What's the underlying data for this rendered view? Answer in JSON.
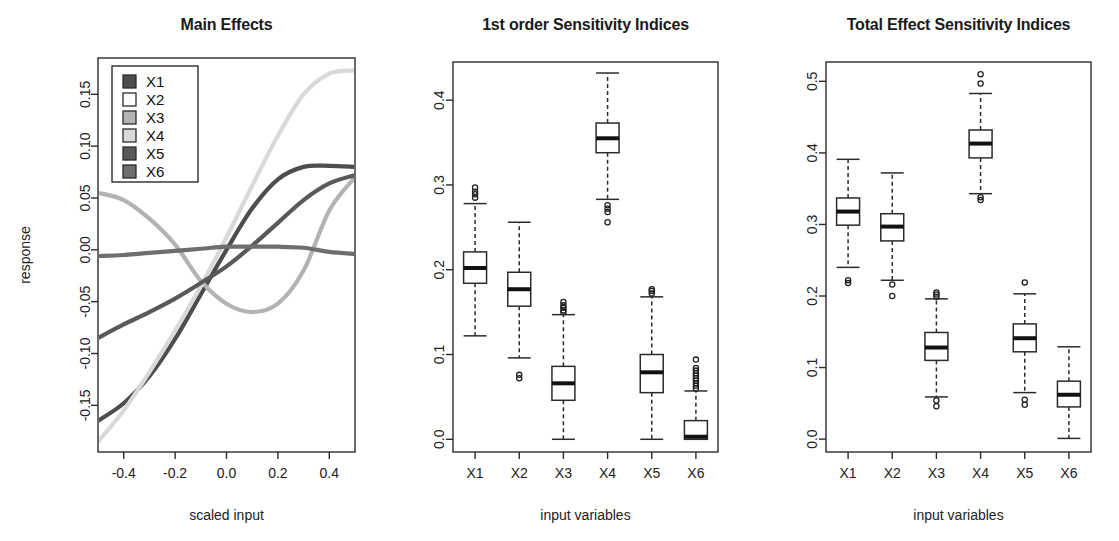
{
  "figure": {
    "variables": [
      "X1",
      "X2",
      "X3",
      "X4",
      "X5",
      "X6"
    ],
    "series_colors": [
      "#4d4d4d",
      "#ffffff",
      "#b3b3b3",
      "#d9d9d9",
      "#595959",
      "#6e6e6e"
    ]
  },
  "panels": {
    "left": {
      "title": "Main Effects",
      "xlabel": "scaled input",
      "ylabel": "response",
      "xticks": [
        "-0.4",
        "-0.2",
        "0.0",
        "0.2",
        "0.4"
      ],
      "yticks": [
        "-0.15",
        "-0.10",
        "-0.05",
        "0.00",
        "0.05",
        "0.10",
        "0.15"
      ],
      "legend": [
        "X1",
        "X2",
        "X3",
        "X4",
        "X5",
        "X6"
      ]
    },
    "middle": {
      "title": "1st order Sensitivity Indices",
      "xlabel": "input variables",
      "xticks": [
        "X1",
        "X2",
        "X3",
        "X4",
        "X5",
        "X6"
      ],
      "yticks": [
        "0.0",
        "0.1",
        "0.2",
        "0.3",
        "0.4"
      ]
    },
    "right": {
      "title": "Total Effect Sensitivity Indices",
      "xlabel": "input variables",
      "xticks": [
        "X1",
        "X2",
        "X3",
        "X4",
        "X5",
        "X6"
      ],
      "yticks": [
        "0.0",
        "0.1",
        "0.2",
        "0.3",
        "0.4",
        "0.5"
      ]
    }
  },
  "chart_data": [
    {
      "type": "line",
      "panel": "left",
      "title": "Main Effects",
      "xlabel": "scaled input",
      "ylabel": "response",
      "xlim": [
        -0.5,
        0.5
      ],
      "ylim": [
        -0.195,
        0.185
      ],
      "grid": false,
      "legend_position": "top-left",
      "x": [
        -0.5,
        -0.4,
        -0.3,
        -0.2,
        -0.1,
        0.0,
        0.1,
        0.2,
        0.3,
        0.4,
        0.5
      ],
      "series": [
        {
          "name": "X1",
          "color": "#4d4d4d",
          "values": [
            -0.165,
            -0.148,
            -0.122,
            -0.086,
            -0.043,
            0.0,
            0.04,
            0.068,
            0.08,
            0.081,
            0.08
          ]
        },
        {
          "name": "X2",
          "color": "#ffffff",
          "values": [
            0.0,
            0.0,
            0.0,
            0.0,
            0.0,
            0.0,
            0.0,
            0.0,
            0.0,
            0.0,
            0.0
          ]
        },
        {
          "name": "X3",
          "color": "#b3b3b3",
          "values": [
            0.055,
            0.048,
            0.03,
            0.005,
            -0.03,
            -0.052,
            -0.06,
            -0.052,
            -0.02,
            0.038,
            0.07
          ]
        },
        {
          "name": "X4",
          "color": "#d9d9d9",
          "values": [
            -0.185,
            -0.155,
            -0.118,
            -0.078,
            -0.035,
            0.012,
            0.062,
            0.11,
            0.15,
            0.17,
            0.173
          ]
        },
        {
          "name": "X5",
          "color": "#595959",
          "values": [
            -0.085,
            -0.072,
            -0.06,
            -0.047,
            -0.032,
            -0.016,
            0.004,
            0.026,
            0.048,
            0.064,
            0.072
          ]
        },
        {
          "name": "X6",
          "color": "#6e6e6e",
          "values": [
            -0.006,
            -0.005,
            -0.003,
            -0.001,
            0.001,
            0.003,
            0.003,
            0.003,
            0.002,
            -0.002,
            -0.004
          ]
        }
      ]
    },
    {
      "type": "boxplot",
      "panel": "middle",
      "title": "1st order Sensitivity Indices",
      "xlabel": "input variables",
      "ylabel": "",
      "categories": [
        "X1",
        "X2",
        "X3",
        "X4",
        "X5",
        "X6"
      ],
      "ylim": [
        -0.015,
        0.445
      ],
      "grid": false,
      "boxes": [
        {
          "name": "X1",
          "whisker_low": 0.122,
          "q1": 0.184,
          "median": 0.202,
          "q3": 0.221,
          "whisker_high": 0.278,
          "outliers": [
            0.285,
            0.289,
            0.292,
            0.297
          ]
        },
        {
          "name": "X2",
          "whisker_low": 0.096,
          "q1": 0.157,
          "median": 0.177,
          "q3": 0.197,
          "whisker_high": 0.256,
          "outliers": [
            0.076,
            0.072
          ]
        },
        {
          "name": "X3",
          "whisker_low": 0.0,
          "q1": 0.046,
          "median": 0.066,
          "q3": 0.086,
          "whisker_high": 0.147,
          "outliers": [
            0.15,
            0.152,
            0.155,
            0.158,
            0.162
          ]
        },
        {
          "name": "X4",
          "whisker_low": 0.283,
          "q1": 0.338,
          "median": 0.355,
          "q3": 0.373,
          "whisker_high": 0.432,
          "outliers": [
            0.276,
            0.272,
            0.268,
            0.256
          ]
        },
        {
          "name": "X5",
          "whisker_low": 0.0,
          "q1": 0.055,
          "median": 0.079,
          "q3": 0.1,
          "whisker_high": 0.168,
          "outliers": [
            0.172,
            0.175,
            0.177
          ]
        },
        {
          "name": "X6",
          "whisker_low": 0.0,
          "q1": 0.0,
          "median": 0.003,
          "q3": 0.022,
          "whisker_high": 0.057,
          "outliers": [
            0.06,
            0.063,
            0.066,
            0.069,
            0.072,
            0.075,
            0.078,
            0.081,
            0.084,
            0.094
          ]
        }
      ]
    },
    {
      "type": "boxplot",
      "panel": "right",
      "title": "Total Effect Sensitivity Indices",
      "xlabel": "input variables",
      "ylabel": "",
      "categories": [
        "X1",
        "X2",
        "X3",
        "X4",
        "X5",
        "X6"
      ],
      "ylim": [
        -0.018,
        0.527
      ],
      "grid": false,
      "boxes": [
        {
          "name": "X1",
          "whisker_low": 0.24,
          "q1": 0.299,
          "median": 0.318,
          "q3": 0.337,
          "whisker_high": 0.391,
          "outliers": [
            0.222,
            0.218
          ]
        },
        {
          "name": "X2",
          "whisker_low": 0.222,
          "q1": 0.277,
          "median": 0.297,
          "q3": 0.315,
          "whisker_high": 0.372,
          "outliers": [
            0.216,
            0.2
          ]
        },
        {
          "name": "X3",
          "whisker_low": 0.059,
          "q1": 0.11,
          "median": 0.128,
          "q3": 0.149,
          "whisker_high": 0.196,
          "outliers": [
            0.199,
            0.202,
            0.205,
            0.054,
            0.046
          ]
        },
        {
          "name": "X4",
          "whisker_low": 0.343,
          "q1": 0.393,
          "median": 0.413,
          "q3": 0.432,
          "whisker_high": 0.483,
          "outliers": [
            0.497,
            0.51,
            0.338,
            0.334
          ]
        },
        {
          "name": "X5",
          "whisker_low": 0.065,
          "q1": 0.122,
          "median": 0.141,
          "q3": 0.161,
          "whisker_high": 0.203,
          "outliers": [
            0.219,
            0.055,
            0.048
          ]
        },
        {
          "name": "X6",
          "whisker_low": 0.001,
          "q1": 0.045,
          "median": 0.062,
          "q3": 0.081,
          "whisker_high": 0.129,
          "outliers": []
        }
      ]
    }
  ]
}
